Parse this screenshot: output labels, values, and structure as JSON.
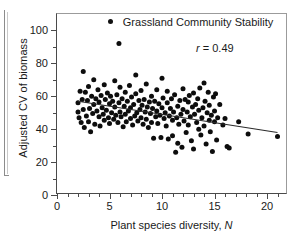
{
  "chart_data": {
    "type": "scatter",
    "title": "",
    "xlabel": "Plant species diversity, N",
    "ylabel": "Adjusted CV of biomass",
    "xlim": [
      0,
      22
    ],
    "ylim": [
      0,
      110
    ],
    "grid": false,
    "legend_position": "top-center",
    "legend": [
      "Grassland Community Stability"
    ],
    "annotations": [
      "r = 0.49"
    ],
    "correlation_label": "r",
    "correlation_value": "0.49",
    "xticks_major": [
      0,
      5,
      10,
      15,
      20
    ],
    "xticks_minor": [
      1,
      2,
      3,
      4,
      6,
      7,
      8,
      9,
      11,
      12,
      13,
      14,
      16,
      17,
      18,
      19,
      21
    ],
    "yticks_major": [
      0,
      20,
      40,
      60,
      80,
      100
    ],
    "yticks_minor": [
      10,
      30,
      50,
      70,
      90
    ],
    "marker": "filled-circle",
    "marker_color": "#0d0d0d",
    "fit_line": {
      "label": "regression line",
      "color": "#2b2b2b",
      "x_start": 2.0,
      "y_start": 57.0,
      "x_end": 21.0,
      "y_end": 38.0
    },
    "points": [
      [
        2.0,
        50.5
      ],
      [
        2.0,
        56.0
      ],
      [
        2.1,
        47.0
      ],
      [
        2.2,
        63.0
      ],
      [
        2.3,
        44.0
      ],
      [
        2.4,
        58.0
      ],
      [
        2.5,
        75.0
      ],
      [
        2.5,
        52.0
      ],
      [
        2.6,
        41.0
      ],
      [
        2.7,
        62.5
      ],
      [
        2.8,
        48.0
      ],
      [
        2.9,
        57.5
      ],
      [
        3.0,
        44.5
      ],
      [
        3.0,
        66.0
      ],
      [
        3.1,
        52.5
      ],
      [
        3.2,
        38.5
      ],
      [
        3.3,
        60.0
      ],
      [
        3.4,
        49.5
      ],
      [
        3.5,
        70.0
      ],
      [
        3.5,
        55.0
      ],
      [
        3.6,
        43.0
      ],
      [
        3.7,
        58.5
      ],
      [
        3.8,
        51.0
      ],
      [
        3.9,
        64.0
      ],
      [
        4.0,
        47.5
      ],
      [
        4.0,
        56.5
      ],
      [
        4.1,
        42.0
      ],
      [
        4.2,
        60.5
      ],
      [
        4.3,
        53.0
      ],
      [
        4.4,
        49.0
      ],
      [
        4.5,
        67.0
      ],
      [
        4.5,
        45.5
      ],
      [
        4.6,
        58.0
      ],
      [
        4.7,
        51.5
      ],
      [
        4.8,
        62.0
      ],
      [
        4.9,
        47.0
      ],
      [
        5.0,
        55.5
      ],
      [
        5.0,
        43.5
      ],
      [
        5.1,
        60.0
      ],
      [
        5.2,
        50.0
      ],
      [
        5.3,
        57.0
      ],
      [
        5.4,
        46.0
      ],
      [
        5.5,
        69.5
      ],
      [
        5.5,
        53.5
      ],
      [
        5.6,
        48.5
      ],
      [
        5.7,
        61.0
      ],
      [
        5.8,
        44.0
      ],
      [
        5.9,
        92.0
      ],
      [
        5.9,
        56.0
      ],
      [
        6.0,
        50.5
      ],
      [
        6.0,
        65.5
      ],
      [
        6.1,
        47.5
      ],
      [
        6.2,
        58.5
      ],
      [
        6.3,
        41.5
      ],
      [
        6.4,
        54.0
      ],
      [
        6.5,
        62.5
      ],
      [
        6.5,
        49.0
      ],
      [
        6.6,
        44.5
      ],
      [
        6.7,
        57.0
      ],
      [
        6.8,
        51.0
      ],
      [
        6.9,
        66.5
      ],
      [
        7.0,
        46.5
      ],
      [
        7.0,
        53.0
      ],
      [
        7.1,
        59.5
      ],
      [
        7.2,
        42.5
      ],
      [
        7.3,
        55.0
      ],
      [
        7.4,
        48.0
      ],
      [
        7.5,
        73.0
      ],
      [
        7.5,
        61.5
      ],
      [
        7.6,
        50.0
      ],
      [
        7.7,
        45.0
      ],
      [
        7.8,
        57.5
      ],
      [
        7.9,
        52.0
      ],
      [
        8.0,
        63.5
      ],
      [
        8.0,
        47.0
      ],
      [
        8.1,
        54.5
      ],
      [
        8.2,
        43.0
      ],
      [
        8.3,
        58.0
      ],
      [
        8.4,
        50.5
      ],
      [
        8.5,
        67.5
      ],
      [
        8.5,
        46.0
      ],
      [
        8.6,
        53.5
      ],
      [
        8.7,
        41.0
      ],
      [
        8.8,
        56.5
      ],
      [
        8.9,
        49.5
      ],
      [
        9.0,
        44.0
      ],
      [
        9.0,
        60.0
      ],
      [
        9.1,
        52.5
      ],
      [
        9.2,
        34.5
      ],
      [
        9.3,
        57.0
      ],
      [
        9.4,
        47.5
      ],
      [
        9.5,
        64.0
      ],
      [
        9.5,
        51.0
      ],
      [
        9.6,
        43.5
      ],
      [
        9.7,
        55.5
      ],
      [
        9.8,
        48.5
      ],
      [
        9.9,
        35.0
      ],
      [
        10.0,
        53.0
      ],
      [
        10.0,
        71.0
      ],
      [
        10.1,
        59.0
      ],
      [
        10.2,
        46.5
      ],
      [
        10.3,
        50.0
      ],
      [
        10.4,
        42.0
      ],
      [
        10.5,
        63.0
      ],
      [
        10.5,
        56.0
      ],
      [
        10.6,
        34.0
      ],
      [
        10.7,
        48.0
      ],
      [
        10.8,
        52.5
      ],
      [
        10.9,
        58.5
      ],
      [
        11.0,
        45.5
      ],
      [
        11.0,
        36.0
      ],
      [
        11.1,
        50.5
      ],
      [
        11.2,
        61.0
      ],
      [
        11.3,
        26.0
      ],
      [
        11.4,
        47.0
      ],
      [
        11.5,
        54.0
      ],
      [
        11.5,
        31.5
      ],
      [
        11.6,
        43.0
      ],
      [
        11.7,
        57.5
      ],
      [
        11.8,
        49.0
      ],
      [
        11.9,
        29.0
      ],
      [
        12.0,
        52.0
      ],
      [
        12.0,
        64.5
      ],
      [
        12.1,
        45.0
      ],
      [
        12.2,
        58.0
      ],
      [
        12.3,
        38.0
      ],
      [
        12.4,
        50.5
      ],
      [
        12.5,
        56.5
      ],
      [
        12.5,
        42.5
      ],
      [
        12.6,
        60.5
      ],
      [
        12.7,
        47.5
      ],
      [
        12.8,
        33.0
      ],
      [
        12.9,
        53.5
      ],
      [
        13.0,
        62.0
      ],
      [
        13.0,
        28.0
      ],
      [
        13.1,
        49.0
      ],
      [
        13.2,
        55.0
      ],
      [
        13.3,
        44.0
      ],
      [
        13.4,
        58.5
      ],
      [
        13.5,
        40.0
      ],
      [
        13.5,
        51.5
      ],
      [
        13.6,
        65.0
      ],
      [
        13.7,
        36.5
      ],
      [
        13.8,
        47.0
      ],
      [
        13.9,
        53.0
      ],
      [
        14.0,
        68.0
      ],
      [
        14.0,
        42.0
      ],
      [
        14.1,
        57.0
      ],
      [
        14.2,
        31.0
      ],
      [
        14.3,
        50.0
      ],
      [
        14.4,
        62.5
      ],
      [
        14.5,
        45.5
      ],
      [
        14.5,
        54.5
      ],
      [
        14.6,
        38.5
      ],
      [
        14.7,
        48.5
      ],
      [
        14.8,
        26.5
      ],
      [
        14.9,
        59.5
      ],
      [
        15.0,
        44.5
      ],
      [
        15.0,
        51.0
      ],
      [
        15.1,
        61.5
      ],
      [
        15.2,
        33.5
      ],
      [
        15.3,
        47.0
      ],
      [
        15.5,
        55.0
      ],
      [
        15.8,
        42.5
      ],
      [
        16.0,
        46.5
      ],
      [
        16.2,
        29.5
      ],
      [
        16.4,
        28.5
      ],
      [
        17.3,
        44.5
      ],
      [
        18.2,
        37.0
      ],
      [
        21.0,
        35.5
      ]
    ]
  }
}
